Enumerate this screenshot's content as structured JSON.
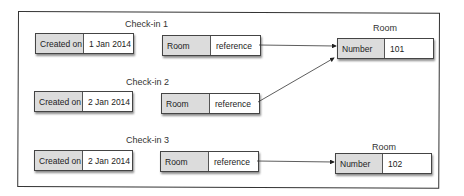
{
  "diagram": {
    "checkins": [
      {
        "title": "Check-in 1",
        "created_label": "Created on",
        "created_value": "1 Jan 2014",
        "ref_label": "Room",
        "ref_value": "reference"
      },
      {
        "title": "Check-in 2",
        "created_label": "Created on",
        "created_value": "2 Jan 2014",
        "ref_label": "Room",
        "ref_value": "reference"
      },
      {
        "title": "Check-in 3",
        "created_label": "Created on",
        "created_value": "2 Jan 2014",
        "ref_label": "Room",
        "ref_value": "reference"
      }
    ],
    "rooms": [
      {
        "title": "Room",
        "field_label": "Number",
        "field_value": "101"
      },
      {
        "title": "Room",
        "field_label": "Number",
        "field_value": "102"
      }
    ],
    "links": [
      {
        "from": "Check-in 1",
        "to": "Room 101"
      },
      {
        "from": "Check-in 2",
        "to": "Room 101"
      },
      {
        "from": "Check-in 3",
        "to": "Room 102"
      }
    ]
  }
}
